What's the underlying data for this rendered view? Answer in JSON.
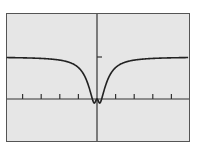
{
  "chart_data": {
    "type": "line",
    "title": "",
    "xlabel": "",
    "ylabel": "",
    "grid": false,
    "legend": null,
    "xlim": [
      -5,
      5
    ],
    "ylim": [
      -1.5,
      2
    ],
    "x_ticks": [
      -4,
      -3,
      -2,
      -1,
      1,
      2,
      3,
      4
    ],
    "y_ticks": [
      1
    ],
    "series": [
      {
        "name": "f(x)",
        "description": "Even function with horizontal asymptote y=1, sharp W-shaped dip near x=0: two minima (~-0.2) at x≈±0.25, local max ~0 at x=0",
        "x": [
          -5,
          -4,
          -3,
          -2,
          -1.5,
          -1,
          -0.75,
          -0.5,
          -0.35,
          -0.25,
          0,
          0.25,
          0.35,
          0.5,
          0.75,
          1,
          1.5,
          2,
          3,
          4,
          5
        ],
        "y": [
          1.0,
          1.0,
          0.99,
          0.97,
          0.93,
          0.82,
          0.68,
          0.42,
          0.1,
          -0.2,
          0.0,
          -0.2,
          0.1,
          0.42,
          0.68,
          0.82,
          0.93,
          0.97,
          0.99,
          1.0,
          1.0
        ]
      }
    ],
    "colors": {
      "background": "#e6e6e6",
      "curve": "#222222",
      "axes": "#333333",
      "frame": "#555555"
    }
  }
}
